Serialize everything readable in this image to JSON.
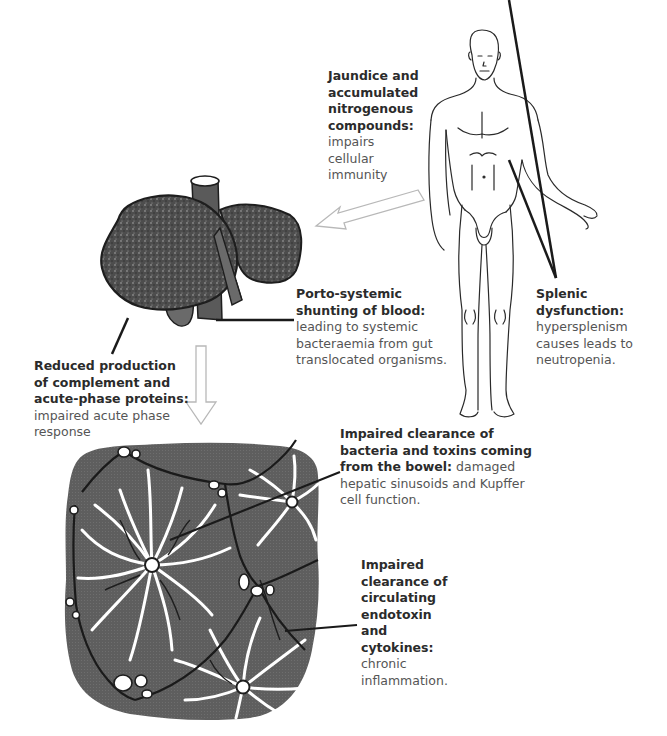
{
  "diagram": {
    "title": "",
    "colors": {
      "background": "#ffffff",
      "liver_fill": "#4a4a4a",
      "tissue_fill": "#5c5c5c",
      "sinusoid": "#ffffff",
      "outline": "#1e1e1e",
      "arrow_fill": "#ffffff",
      "arrow_stroke": "#b5b5b5",
      "heading_text": "#2b2b2b",
      "body_text": "#555555"
    },
    "figures": [
      {
        "id": "human-body",
        "desc": "Line drawing of standing human figure"
      },
      {
        "id": "liver",
        "desc": "Stippled cirrhotic liver with portal vein and gallbladder"
      },
      {
        "id": "liver-lobules",
        "desc": "Hepatic lobule histology with radiating sinusoids and central veins"
      }
    ],
    "arrows": [
      {
        "id": "body-to-liver",
        "from": "human-body",
        "to": "liver"
      },
      {
        "id": "liver-to-lobules",
        "from": "liver",
        "to": "liver-lobules"
      }
    ],
    "annotations": {
      "jaundice": {
        "heading": [
          "Jaundice and",
          "accumulated",
          "nitrogenous",
          "compounds:"
        ],
        "body": [
          "impairs",
          "cellular",
          "immunity"
        ]
      },
      "porto_systemic": {
        "heading": [
          "Porto-systemic",
          "shunting of blood:"
        ],
        "body": [
          "leading to systemic",
          "bacteraemia from gut",
          "translocated organisms."
        ]
      },
      "splenic": {
        "heading": [
          "Splenic",
          "dysfunction:"
        ],
        "body": [
          "hypersplenism",
          "causes leads to",
          "neutropenia."
        ]
      },
      "complement": {
        "heading": [
          "Reduced production",
          "of complement and",
          "acute-phase proteins:"
        ],
        "body": [
          "impaired acute phase",
          "response"
        ]
      },
      "bacteria_clearance": {
        "heading": [
          "Impaired clearance of",
          "bacteria and toxins coming",
          "from the bowel:"
        ],
        "body_inline": "damaged",
        "body": [
          "hepatic sinusoids and Kupffer",
          "cell function."
        ]
      },
      "endotoxin": {
        "heading": [
          "Impaired",
          "clearance of",
          "circulating",
          "endotoxin",
          "and",
          "cytokines:"
        ],
        "body": [
          "chronic",
          "inflammation."
        ]
      }
    }
  }
}
